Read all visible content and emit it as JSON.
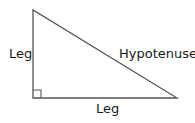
{
  "diagram": {
    "stroke_color": "#555555",
    "labels": {
      "left_leg": "Leg",
      "hypotenuse": "Hypotenuse",
      "bottom_leg": "Leg"
    }
  }
}
